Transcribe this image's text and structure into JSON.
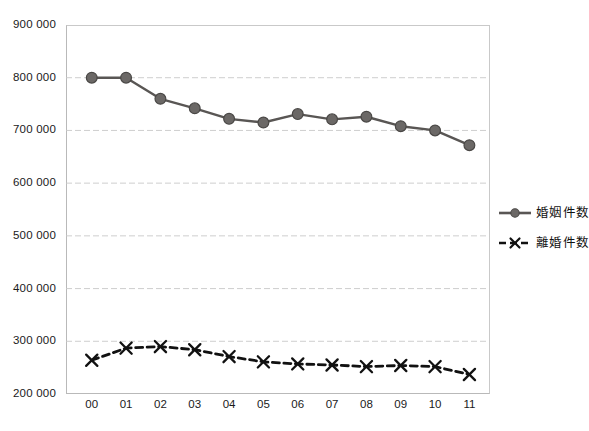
{
  "chart_data": {
    "type": "line",
    "title": "",
    "subtitle": "",
    "xlabel": "",
    "ylabel": "",
    "categories": [
      "00",
      "01",
      "02",
      "03",
      "04",
      "05",
      "06",
      "07",
      "08",
      "09",
      "10",
      "11"
    ],
    "ylim": [
      200000,
      900000
    ],
    "y_ticks": [
      200000,
      300000,
      400000,
      500000,
      600000,
      700000,
      800000,
      900000
    ],
    "y_tick_labels": [
      "200 000",
      "300 000",
      "400 000",
      "500 000",
      "600 000",
      "700 000",
      "800 000",
      "900 000"
    ],
    "grid": true,
    "grid_style": "dashed-horizontal",
    "legend_position": "right",
    "series": [
      {
        "name": "婚姻件数",
        "marker": "circle",
        "line_style": "solid",
        "color": "#595654",
        "values": [
          800000,
          800000,
          760000,
          742000,
          722000,
          715000,
          731000,
          721000,
          726000,
          708000,
          700000,
          672000
        ]
      },
      {
        "name": "離婚件数",
        "marker": "x",
        "line_style": "dashed",
        "color": "#111111",
        "values": [
          264000,
          287000,
          290000,
          284000,
          271000,
          261000,
          257000,
          255000,
          252000,
          254000,
          252000,
          237000
        ]
      }
    ]
  },
  "legend": {
    "items": [
      {
        "label": "婚姻件数",
        "marker": "circle-solid-line",
        "color": "#595654"
      },
      {
        "label": "離婚件数",
        "marker": "x-dashed-line",
        "color": "#111111"
      }
    ]
  },
  "axes": {
    "x_tick_labels": [
      "00",
      "01",
      "02",
      "03",
      "04",
      "05",
      "06",
      "07",
      "08",
      "09",
      "10",
      "11"
    ],
    "y_tick_labels": [
      "900 000",
      "800 000",
      "700 000",
      "600 000",
      "500 000",
      "400 000",
      "300 000",
      "200 000"
    ]
  },
  "colors": {
    "marriage_series": "#595654",
    "divorce_series": "#111111",
    "gridline": "#c8c8c8",
    "axis": "#b9b9b9",
    "background": "#ffffff",
    "text": "#1a1a1a"
  }
}
